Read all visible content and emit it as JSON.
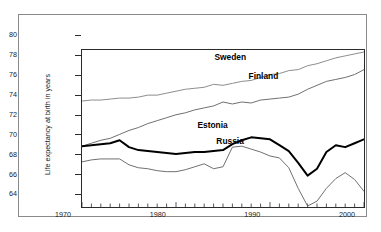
{
  "chart_data": {
    "type": "line",
    "title": "",
    "xlabel": "",
    "ylabel": "Life expectancy at birth in years",
    "xlim": [
      1970,
      2000
    ],
    "ylim": [
      64,
      80
    ],
    "grid": false,
    "legend_position": "inline-labels",
    "y_ticks": [
      64,
      66,
      68,
      70,
      72,
      74,
      76,
      78,
      80
    ],
    "x_ticks": [
      1970,
      1980,
      1990,
      2000
    ],
    "x_tick_labels": [
      "1970",
      "1980",
      "1990",
      "2000"
    ],
    "x_minor_tick_interval": 1,
    "x": [
      1970,
      1971,
      1972,
      1973,
      1974,
      1975,
      1976,
      1977,
      1978,
      1979,
      1980,
      1981,
      1982,
      1983,
      1984,
      1985,
      1986,
      1987,
      1988,
      1989,
      1990,
      1991,
      1992,
      1993,
      1994,
      1995,
      1996,
      1997,
      1998,
      1999,
      2000
    ],
    "series": [
      {
        "name": "Sweden",
        "color": "#8c8c8c",
        "line_width": 1,
        "values": [
          74.8,
          74.9,
          74.9,
          75.0,
          75.1,
          75.1,
          75.2,
          75.4,
          75.4,
          75.6,
          75.8,
          76.0,
          76.1,
          76.2,
          76.5,
          76.4,
          76.6,
          76.8,
          76.9,
          77.2,
          77.5,
          77.6,
          77.9,
          78.0,
          78.4,
          78.6,
          78.9,
          79.2,
          79.4,
          79.6,
          79.8
        ]
      },
      {
        "name": "Finland",
        "color": "#6e6e6e",
        "line_width": 1,
        "values": [
          70.2,
          70.5,
          70.8,
          71.0,
          71.4,
          71.8,
          72.1,
          72.5,
          72.8,
          73.1,
          73.4,
          73.6,
          73.9,
          74.1,
          74.3,
          74.7,
          74.5,
          74.7,
          74.6,
          74.9,
          75.0,
          75.1,
          75.2,
          75.5,
          76.0,
          76.4,
          76.8,
          77.0,
          77.2,
          77.5,
          78.0
        ]
      },
      {
        "name": "Estonia",
        "color": "#000000",
        "line_width": 2,
        "values": [
          70.2,
          70.3,
          70.4,
          70.5,
          70.8,
          70.1,
          69.8,
          69.7,
          69.6,
          69.5,
          69.4,
          69.5,
          69.6,
          69.6,
          69.7,
          69.8,
          70.4,
          70.8,
          71.1,
          71.0,
          70.9,
          70.3,
          69.7,
          68.5,
          67.2,
          67.9,
          69.6,
          70.3,
          70.1,
          70.5,
          70.9
        ]
      },
      {
        "name": "Russia",
        "color": "#6e6e6e",
        "line_width": 1,
        "values": [
          68.6,
          68.8,
          68.9,
          68.9,
          68.9,
          68.3,
          68.0,
          67.9,
          67.7,
          67.6,
          67.6,
          67.8,
          68.1,
          68.4,
          67.9,
          68.1,
          70.1,
          70.2,
          69.9,
          69.6,
          69.2,
          69.0,
          68.0,
          65.9,
          64.1,
          64.6,
          65.9,
          66.9,
          67.5,
          66.8,
          65.6
        ]
      }
    ],
    "inline_labels": [
      {
        "text": "Sweden",
        "x": 1986.0,
        "y": 77.8
      },
      {
        "text": "Finland",
        "x": 1989.6,
        "y": 75.9
      },
      {
        "text": "Estonia",
        "x": 1984.2,
        "y": 70.9
      },
      {
        "text": "Russia",
        "x": 1986.2,
        "y": 69.3
      }
    ]
  }
}
